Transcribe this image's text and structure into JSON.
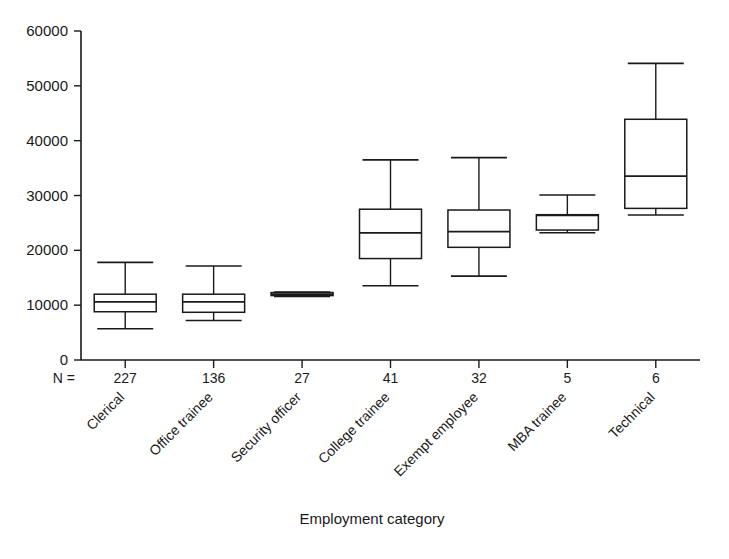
{
  "chart_data": {
    "type": "box",
    "title": "",
    "xlabel": "Employment category",
    "ylabel": "",
    "ylim": [
      0,
      60000
    ],
    "ytick_labels": [
      "0",
      "10000",
      "20000",
      "30000",
      "40000",
      "50000",
      "60000"
    ],
    "ytick_values": [
      0,
      10000,
      20000,
      30000,
      40000,
      50000,
      60000
    ],
    "grid": false,
    "legend": "none",
    "n_prefix": "N =",
    "categories": [
      "Clerical",
      "Office trainee",
      "Security officer",
      "College trainee",
      "Exempt employee",
      "MBA trainee",
      "Technical"
    ],
    "counts": [
      227,
      136,
      27,
      41,
      32,
      5,
      6
    ],
    "boxes": [
      {
        "category": "Clerical",
        "n": 227,
        "whisker_low": 5700,
        "q1": 8800,
        "median": 10600,
        "q3": 12000,
        "whisker_high": 17800
      },
      {
        "category": "Office trainee",
        "n": 136,
        "whisker_low": 7200,
        "q1": 8700,
        "median": 10600,
        "q3": 12000,
        "whisker_high": 17150
      },
      {
        "category": "Security officer",
        "n": 27,
        "whisker_low": 11600,
        "q1": 11750,
        "median": 12000,
        "q3": 12300,
        "whisker_high": 12400
      },
      {
        "category": "College trainee",
        "n": 41,
        "whisker_low": 13550,
        "q1": 18500,
        "median": 23200,
        "q3": 27500,
        "whisker_high": 36500
      },
      {
        "category": "Exempt employee",
        "n": 32,
        "whisker_low": 15300,
        "q1": 20550,
        "median": 23400,
        "q3": 27350,
        "whisker_high": 36900
      },
      {
        "category": "MBA trainee",
        "n": 5,
        "whisker_low": 23200,
        "q1": 23700,
        "median": 26400,
        "q3": 26500,
        "whisker_high": 30100
      },
      {
        "category": "Technical",
        "n": 6,
        "whisker_low": 26450,
        "q1": 27650,
        "median": 33550,
        "q3": 43900,
        "whisker_high": 54100
      }
    ],
    "colors": {
      "axis": "#1a1a1a",
      "box_fill": "#ffffff",
      "box_stroke": "#1a1a1a",
      "background": "#ffffff"
    }
  }
}
